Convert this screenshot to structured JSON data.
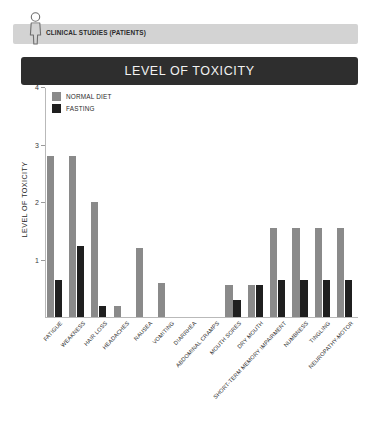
{
  "header": {
    "icon": "patient-person-icon",
    "label": "CLINICAL STUDIES (PATIENTS)"
  },
  "banner": {
    "title": "LEVEL OF TOXICITY"
  },
  "colors": {
    "normal_diet": "#8a8a8a",
    "fasting": "#1f1f1f",
    "banner_bg": "#2e2e2e",
    "header_bg": "#d3d3d3",
    "axis": "#b9b9b9"
  },
  "chart_data": {
    "type": "bar",
    "title": "LEVEL OF TOXICITY",
    "xlabel": "",
    "ylabel": "LEVEL OF TOXICITY",
    "ylim": [
      0,
      4
    ],
    "yticks": [
      1,
      2,
      3,
      4
    ],
    "grid": false,
    "legend_position": "top-left",
    "categories": [
      "FATIGUE",
      "WEAKNESS",
      "HAIR LOSS",
      "HEADACHES",
      "NAUSEA",
      "VOMITING",
      "DIARRHEA",
      "ABDOMINAL CRAMPS",
      "MOUTH SORES",
      "DRY MOUTH",
      "SHORT-TERM MEMORY IMPAIRMENT",
      "NUMBNESS",
      "TINGLING",
      "NEUROPATHY-MOTOR"
    ],
    "series": [
      {
        "name": "NORMAL DIET",
        "color": "#8a8a8a",
        "values": [
          2.8,
          2.8,
          2.0,
          0.2,
          1.2,
          0.6,
          0,
          0,
          0.55,
          0.55,
          1.55,
          1.55,
          1.55,
          1.55
        ]
      },
      {
        "name": "FASTING",
        "color": "#1f1f1f",
        "values": [
          0.65,
          1.23,
          0.2,
          0,
          0,
          0,
          0,
          0,
          0.3,
          0.55,
          0.65,
          0.65,
          0.65,
          0.65
        ]
      }
    ]
  }
}
